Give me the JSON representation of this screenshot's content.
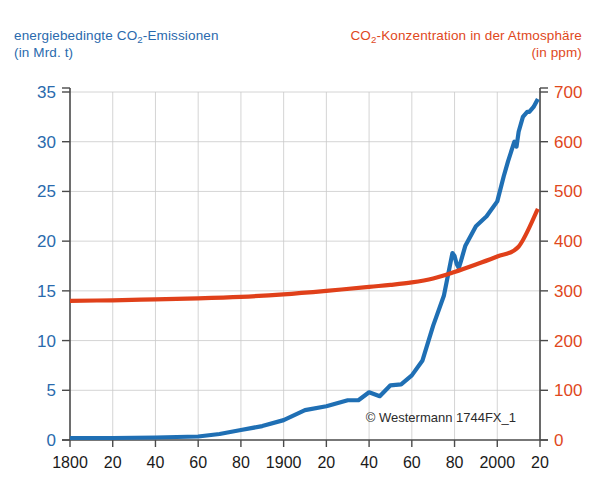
{
  "titles": {
    "left": {
      "line1_pre": "energiebedingte CO",
      "line1_sub": "2",
      "line1_post": "-Emissionen",
      "line2": "(in Mrd. t)",
      "color": "#2a6aad"
    },
    "right": {
      "line1_pre": "CO",
      "line1_sub": "2",
      "line1_post": "-Konzentration in der Atmosphäre",
      "line2": "(in ppm)",
      "color": "#e0481c"
    }
  },
  "credit": "© Westermann 1744FX_1",
  "chart_data": {
    "type": "line",
    "xlabel": "",
    "ylabel": "energiebedingte CO2-Emissionen (in Mrd. t)",
    "y2label": "CO2-Konzentration in der Atmosphäre (in ppm)",
    "xlim": [
      1800,
      2020
    ],
    "ylim": [
      0,
      35
    ],
    "y2lim": [
      0,
      700
    ],
    "grid": true,
    "legend": "none",
    "x_tick_values": [
      1800,
      1820,
      1840,
      1860,
      1880,
      1900,
      1920,
      1940,
      1960,
      1980,
      2000,
      2020
    ],
    "x_tick_labels": [
      "1800",
      "20",
      "40",
      "60",
      "80",
      "1900",
      "20",
      "40",
      "60",
      "80",
      "2000",
      "20"
    ],
    "y_tick_values": [
      0,
      5,
      10,
      15,
      20,
      25,
      30,
      35
    ],
    "y_tick_labels": [
      "0",
      "5",
      "10",
      "15",
      "20",
      "25",
      "30",
      "35"
    ],
    "y2_tick_values": [
      0,
      100,
      200,
      300,
      400,
      500,
      600,
      700
    ],
    "y2_tick_labels": [
      "0",
      "100",
      "200",
      "300",
      "400",
      "500",
      "600",
      "700"
    ],
    "series": [
      {
        "name": "energiebedingte CO2-Emissionen",
        "axis": "left",
        "unit": "Mrd. t",
        "color": "#1f6fb4",
        "x": [
          1800,
          1820,
          1840,
          1860,
          1870,
          1880,
          1890,
          1900,
          1910,
          1920,
          1930,
          1935,
          1940,
          1945,
          1950,
          1955,
          1960,
          1965,
          1970,
          1975,
          1979,
          1980,
          1981,
          1982,
          1983,
          1985,
          1990,
          1995,
          2000,
          2003,
          2005,
          2008,
          2009,
          2010,
          2012,
          2014,
          2015,
          2017,
          2019
        ],
        "y": [
          0.2,
          0.2,
          0.25,
          0.35,
          0.6,
          1.0,
          1.4,
          2.0,
          3.0,
          3.4,
          4.0,
          4.0,
          4.8,
          4.4,
          5.5,
          5.6,
          6.5,
          8.0,
          11.5,
          14.5,
          18.8,
          18.5,
          17.7,
          17.3,
          18.0,
          19.5,
          21.5,
          22.5,
          24.0,
          26.5,
          28.0,
          30.0,
          29.5,
          31.0,
          32.5,
          33.0,
          33.0,
          33.5,
          34.3
        ]
      },
      {
        "name": "CO2-Konzentration in der Atmosphäre",
        "axis": "right",
        "unit": "ppm",
        "color": "#e0401a",
        "x": [
          1800,
          1820,
          1840,
          1860,
          1880,
          1900,
          1920,
          1940,
          1950,
          1960,
          1970,
          1980,
          1990,
          2000,
          2010,
          2019
        ],
        "y": [
          280,
          281,
          283,
          285,
          288,
          293,
          300,
          308,
          312,
          317,
          325,
          338,
          353,
          369,
          389,
          465
        ]
      }
    ]
  }
}
